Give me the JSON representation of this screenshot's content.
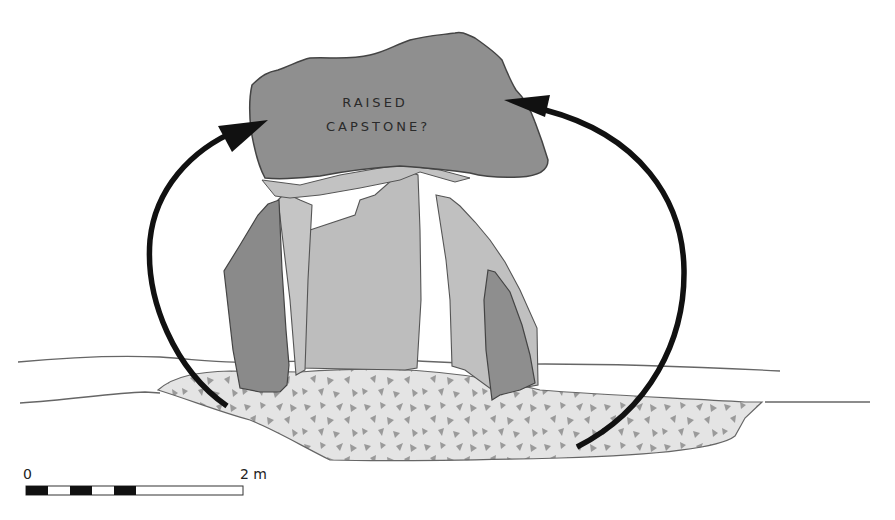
{
  "figure": {
    "label": {
      "line1": "RAISED",
      "line2": "CAPSTONE?"
    },
    "scale_bar": {
      "start_label": "0",
      "end_label": "2 m",
      "segments": [
        "black",
        "white",
        "black",
        "white",
        "black",
        "white-long"
      ]
    },
    "colors": {
      "capstone": "#8f8f8f",
      "light_stone": "#bdbdbd",
      "dark_stone": "#8a8a8a",
      "pit_fill": "#e4e4e4",
      "pit_flecks": "#9a9a9a",
      "outline": "#555555",
      "arrow": "#111111",
      "background": "#ffffff"
    },
    "elements": [
      "capstone",
      "left-orthostat-dark",
      "left-orthostat-light",
      "center-orthostat",
      "right-orthostat-light",
      "right-orthostat-dark",
      "stone-packed-pit",
      "ground-surface-line",
      "left-curved-arrow",
      "right-curved-arrow"
    ]
  }
}
